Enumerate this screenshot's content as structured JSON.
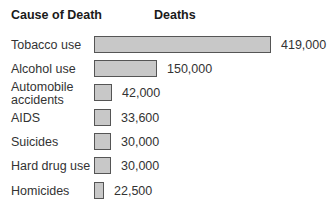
{
  "header": {
    "cause_label": "Cause of Death",
    "deaths_label": "Deaths"
  },
  "colors": {
    "bar_fill": "#c8c8c8",
    "bar_border": "#555555"
  },
  "rows": [
    {
      "cause": "Tobacco use",
      "deaths": 419000,
      "label": "419,000"
    },
    {
      "cause": "Alcohol use",
      "deaths": 150000,
      "label": "150,000"
    },
    {
      "cause": "Automobile accidents",
      "deaths": 42000,
      "label": "42,000"
    },
    {
      "cause": "AIDS",
      "deaths": 33600,
      "label": "33,600"
    },
    {
      "cause": "Suicides",
      "deaths": 30000,
      "label": "30,000"
    },
    {
      "cause": "Hard drug use",
      "deaths": 30000,
      "label": "30,000"
    },
    {
      "cause": "Homicides",
      "deaths": 22500,
      "label": "22,500"
    }
  ],
  "chart_data": {
    "type": "bar",
    "orientation": "horizontal",
    "title": "",
    "xlabel": "Deaths",
    "ylabel": "Cause of Death",
    "categories": [
      "Tobacco use",
      "Alcohol use",
      "Automobile accidents",
      "AIDS",
      "Suicides",
      "Hard drug use",
      "Homicides"
    ],
    "values": [
      419000,
      150000,
      42000,
      33600,
      30000,
      30000,
      22500
    ],
    "data_labels": [
      "419,000",
      "150,000",
      "42,000",
      "33,600",
      "30,000",
      "30,000",
      "22,500"
    ],
    "grid": false,
    "legend": null
  }
}
